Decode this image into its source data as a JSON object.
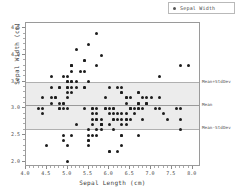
{
  "chart_data": {
    "type": "scatter",
    "title": "",
    "xlabel": "Sepal Length (cm)",
    "ylabel": "Sepal Width (cm)",
    "xlim": [
      4.0,
      8.2
    ],
    "ylim": [
      1.9,
      4.6
    ],
    "xticks": [
      4.0,
      4.5,
      5.0,
      5.5,
      6.0,
      6.5,
      7.0,
      7.5,
      8.0
    ],
    "xticklabels": [
      "4.0",
      "4.5",
      "5.0",
      "5.5",
      "6.0",
      "6.5",
      "7.0",
      "7.5",
      "8.0"
    ],
    "yticks": [
      2.0,
      2.5,
      3.0,
      3.5,
      4.0,
      4.5
    ],
    "yticklabels": [
      "2.0",
      "2.5",
      "3.0",
      "3.5",
      "4.0",
      "4.5"
    ],
    "grid": false,
    "legend_position": "upper right",
    "series": [
      {
        "name": "Sepal Width",
        "marker": "circle",
        "color": "#1d1d1d",
        "x": [
          5.1,
          4.9,
          4.7,
          4.6,
          5.0,
          5.4,
          4.6,
          5.0,
          4.4,
          4.9,
          5.4,
          4.8,
          4.8,
          4.3,
          5.8,
          5.7,
          5.4,
          5.1,
          5.7,
          5.1,
          5.4,
          5.1,
          4.6,
          5.1,
          4.8,
          5.0,
          5.0,
          5.2,
          5.2,
          4.7,
          4.8,
          5.4,
          5.2,
          5.5,
          4.9,
          5.0,
          5.5,
          4.9,
          4.4,
          5.1,
          5.0,
          4.5,
          4.4,
          5.0,
          5.1,
          4.8,
          5.1,
          4.6,
          5.3,
          5.0,
          7.0,
          6.4,
          6.9,
          5.5,
          6.5,
          5.7,
          6.3,
          4.9,
          6.6,
          5.2,
          5.0,
          5.9,
          6.0,
          6.1,
          5.6,
          6.7,
          5.6,
          5.8,
          6.2,
          5.6,
          5.9,
          6.1,
          6.3,
          6.1,
          6.4,
          6.6,
          6.8,
          6.7,
          6.0,
          5.7,
          5.5,
          5.5,
          5.8,
          6.0,
          5.4,
          6.0,
          6.7,
          6.3,
          5.6,
          5.5,
          5.5,
          6.1,
          5.8,
          5.0,
          5.6,
          5.7,
          5.7,
          6.2,
          5.1,
          5.7,
          6.3,
          5.8,
          7.1,
          6.3,
          6.5,
          7.6,
          4.9,
          7.3,
          6.7,
          7.2,
          6.5,
          6.4,
          6.8,
          5.7,
          5.8,
          6.4,
          6.5,
          7.7,
          7.7,
          6.0,
          6.9,
          5.6,
          7.7,
          6.3,
          6.7,
          7.2,
          6.2,
          6.1,
          6.4,
          7.2,
          7.4,
          7.9,
          6.4,
          6.3,
          6.1,
          7.7,
          6.3,
          6.4,
          6.0,
          6.9,
          6.7,
          6.9,
          5.8,
          6.8,
          6.7,
          6.7,
          6.3,
          6.5,
          6.2,
          5.9
        ],
        "y": [
          3.5,
          3.0,
          3.2,
          3.1,
          3.6,
          3.9,
          3.4,
          3.4,
          2.9,
          3.1,
          3.7,
          3.4,
          3.0,
          3.0,
          4.0,
          4.4,
          3.9,
          3.5,
          3.8,
          3.8,
          3.4,
          3.7,
          3.6,
          3.3,
          3.4,
          3.0,
          3.4,
          3.5,
          3.4,
          3.2,
          3.1,
          3.4,
          4.1,
          4.2,
          3.1,
          3.2,
          3.5,
          3.6,
          3.0,
          3.4,
          3.5,
          2.3,
          3.2,
          3.5,
          3.8,
          3.0,
          3.8,
          3.2,
          3.7,
          3.3,
          3.2,
          3.2,
          3.1,
          2.3,
          2.8,
          2.8,
          3.3,
          2.4,
          2.9,
          2.7,
          2.0,
          3.0,
          2.2,
          2.9,
          2.9,
          3.1,
          3.0,
          2.7,
          2.2,
          2.5,
          3.2,
          2.8,
          2.5,
          2.8,
          2.9,
          3.0,
          2.8,
          3.0,
          2.9,
          2.6,
          2.4,
          2.4,
          2.7,
          2.7,
          3.0,
          3.4,
          3.1,
          2.3,
          3.0,
          2.5,
          2.6,
          3.0,
          2.6,
          2.3,
          2.7,
          3.0,
          2.9,
          2.9,
          2.5,
          2.8,
          3.3,
          2.7,
          3.0,
          2.9,
          3.0,
          3.0,
          2.5,
          2.9,
          2.5,
          3.6,
          3.2,
          2.7,
          3.0,
          2.5,
          2.8,
          3.2,
          3.0,
          3.8,
          2.6,
          2.2,
          3.2,
          2.8,
          2.8,
          2.7,
          3.3,
          3.2,
          2.8,
          3.0,
          2.8,
          3.0,
          2.8,
          3.8,
          2.8,
          2.8,
          2.6,
          3.0,
          3.4,
          3.1,
          3.0,
          3.1,
          3.1,
          3.1,
          2.7,
          3.2,
          3.3,
          3.0,
          2.5,
          3.0,
          3.4,
          3.0
        ]
      }
    ],
    "reference_lines": [
      {
        "label": "Mean+StdDev",
        "value": 3.493,
        "color": "#b0b0b0"
      },
      {
        "label": "Mean",
        "value": 3.057,
        "color": "#9a9a9a"
      },
      {
        "label": "Mean-StdDev",
        "value": 2.621,
        "color": "#b0b0b0"
      }
    ],
    "band": {
      "lower": 2.621,
      "upper": 3.493,
      "color": "#ececec"
    }
  },
  "legend": {
    "marker_name": "legend-marker",
    "label": "Sepal Width"
  },
  "axes": {
    "xtitle": "Sepal Length (cm)",
    "ytitle": "Sepal Width (cm)"
  }
}
